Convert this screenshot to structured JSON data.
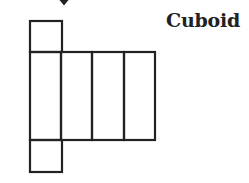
{
  "diagram": {
    "title": "Cuboid",
    "type": "net-of-cuboid",
    "stroke_color": "#222222",
    "background": "#ffffff",
    "faces": [
      {
        "id": "top-flap",
        "x": 30,
        "y": 21,
        "w": 32,
        "h": 31
      },
      {
        "id": "face-1",
        "x": 30,
        "y": 52,
        "w": 31,
        "h": 88
      },
      {
        "id": "face-2",
        "x": 61,
        "y": 52,
        "w": 31,
        "h": 88
      },
      {
        "id": "face-3",
        "x": 92,
        "y": 52,
        "w": 32,
        "h": 88
      },
      {
        "id": "face-4",
        "x": 124,
        "y": 52,
        "w": 31,
        "h": 88
      },
      {
        "id": "bottom-flap",
        "x": 30,
        "y": 140,
        "w": 32,
        "h": 32
      }
    ],
    "arrow": {
      "direction": "down",
      "x": 64,
      "y": 0
    }
  }
}
